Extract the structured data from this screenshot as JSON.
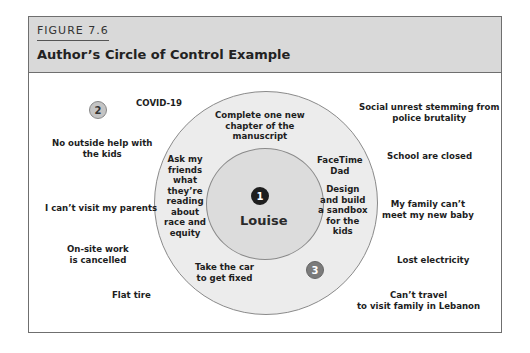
{
  "figure": {
    "label": "FIGURE 7.6",
    "title": "Author’s Circle of Control Example"
  },
  "colors": {
    "header_bg": "#d9d9d9",
    "outer_circle": "#ececec",
    "inner_circle": "#dcdcdc",
    "badge_1": "#1e1e1e",
    "badge_2": "#c4c4c4",
    "badge_3": "#7b7b7b"
  },
  "center": {
    "badge": "1",
    "name": "Louise"
  },
  "badges": {
    "outside": "2",
    "influence": "3"
  },
  "influence_ring": [
    "Complete one new\nchapter of the\nmanuscript",
    "Ask my\nfriends\nwhat\nthey’re\nreading\nabout\nrace and\nequity",
    "FaceTime\nDad",
    "Design\nand build\na sandbox\nfor the\nkids",
    "Take the car\nto get fixed"
  ],
  "outside_left": [
    "COVID-19",
    "No outside help with\nthe kids",
    "I can’t visit my parents",
    "On-site work\nis cancelled",
    "Flat tire"
  ],
  "outside_right": [
    "Social unrest stemming from\npolice brutality",
    "School are closed",
    "My family can’t\nmeet my new baby",
    "Lost electricity",
    "Can’t travel\nto visit family in Lebanon"
  ]
}
